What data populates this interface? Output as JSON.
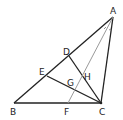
{
  "diagram": {
    "points": {
      "A": "A",
      "B": "B",
      "C": "C",
      "D": "D",
      "E": "E",
      "F": "F",
      "G": "G",
      "H": "H"
    },
    "segments": [
      "AB",
      "BC",
      "CA",
      "DC",
      "EC",
      "AF"
    ],
    "angle_marks": [
      "angle-BAF",
      "angle-FAC"
    ],
    "colors": {
      "main": "#222222",
      "bisector": "#9a9a9a"
    }
  }
}
